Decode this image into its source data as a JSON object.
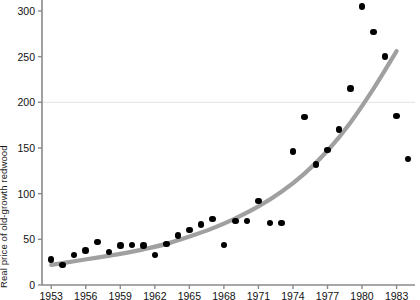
{
  "chart_data": {
    "type": "scatter",
    "title": "",
    "xlabel": "",
    "ylabel": "Real price of old-growth redwood",
    "xlim": [
      1952.2,
      1984.6
    ],
    "ylim": [
      0,
      312
    ],
    "xticks": [
      1953,
      1956,
      1959,
      1962,
      1965,
      1968,
      1971,
      1974,
      1977,
      1980,
      1983
    ],
    "yticks": [
      0,
      50,
      100,
      150,
      200,
      250,
      300
    ],
    "grid": "single horizontal gridline at y=200",
    "gridlines_y": [
      200
    ],
    "legend": "none",
    "x": [
      1953,
      1954,
      1955,
      1956,
      1957,
      1958,
      1959,
      1960,
      1961,
      1962,
      1963,
      1964,
      1965,
      1966,
      1967,
      1968,
      1969,
      1970,
      1971,
      1972,
      1973,
      1974,
      1975,
      1976,
      1977,
      1978,
      1979,
      1980,
      1981,
      1982,
      1983,
      1984
    ],
    "values": [
      28,
      22,
      33,
      38,
      47,
      36,
      43,
      44,
      43,
      33,
      45,
      54,
      60,
      66,
      72,
      44,
      70,
      70,
      92,
      68,
      68,
      146,
      184,
      132,
      148,
      170,
      215,
      305,
      277,
      250,
      185,
      138
    ],
    "series": [
      {
        "name": "Real price of old-growth redwood",
        "marker": "filled-circle",
        "color": "#000000",
        "values": [
          28,
          22,
          33,
          38,
          47,
          36,
          43,
          44,
          43,
          33,
          45,
          54,
          60,
          66,
          72,
          44,
          70,
          70,
          92,
          68,
          68,
          146,
          184,
          132,
          148,
          170,
          215,
          305,
          277,
          250,
          185,
          138
        ]
      },
      {
        "name": "fitted exponential trend",
        "marker": "line",
        "color": "#a0a0a0",
        "x": [
          1953,
          1955,
          1957,
          1959,
          1961,
          1963,
          1965,
          1967,
          1969,
          1971,
          1973,
          1975,
          1977,
          1979,
          1981,
          1983
        ],
        "values": [
          22,
          26,
          30,
          34,
          39,
          45,
          53,
          62,
          73,
          86,
          102,
          122,
          147,
          178,
          215,
          256
        ]
      }
    ]
  },
  "axis": {
    "y_title": "Real price of old-growth redwood",
    "y_tick_labels": [
      "300",
      "250",
      "200",
      "150",
      "100",
      "50",
      "0"
    ],
    "x_tick_labels": [
      "1953",
      "1956",
      "1959",
      "1962",
      "1965",
      "1968",
      "1971",
      "1974",
      "1977",
      "1980",
      "1983"
    ]
  },
  "colors": {
    "marker": "#000000",
    "trend_line": "#a0a0a0",
    "axis": "#8a8a8a",
    "gridline": "#e8e8e8",
    "background": "#ffffff",
    "text": "#111111"
  }
}
